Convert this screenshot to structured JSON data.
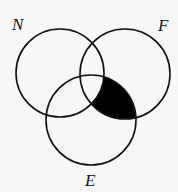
{
  "diagram": {
    "type": "venn-3",
    "sets": [
      {
        "label": "N",
        "cx": 60,
        "cy": 73,
        "r": 44,
        "label_x": 12,
        "label_y": 30
      },
      {
        "label": "F",
        "cx": 125,
        "cy": 74,
        "r": 45,
        "label_x": 158,
        "label_y": 31
      },
      {
        "label": "E",
        "cx": 91,
        "cy": 120,
        "r": 45,
        "label_x": 85,
        "label_y": 186
      }
    ],
    "shaded_region": "F ∩ E − N",
    "shade_color": "#000000",
    "line_color": "#111111",
    "background": "#f7f7f7"
  }
}
